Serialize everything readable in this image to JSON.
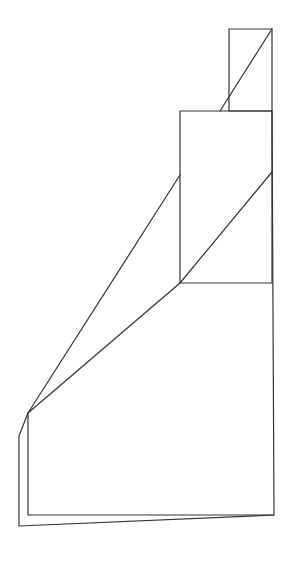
{
  "diagram": {
    "kind": "line-drawing",
    "width": 291,
    "height": 564,
    "background": "#ffffff",
    "stroke_color": "#333333",
    "stroke_width": 1.2,
    "shapes": [
      {
        "name": "top-small-rect",
        "type": "rect",
        "x": 229,
        "y": 29,
        "w": 43,
        "h": 82
      },
      {
        "name": "middle-rect",
        "type": "rect",
        "x": 180,
        "y": 111,
        "w": 92,
        "h": 172
      },
      {
        "name": "top-diagonal",
        "type": "polyline",
        "points": "272,29 220,111"
      },
      {
        "name": "outer-slant-line",
        "type": "polyline",
        "points": "28,413 180,175"
      },
      {
        "name": "inner-slant-line",
        "type": "polyline",
        "points": "28,413 180,283 272,172"
      },
      {
        "name": "front-face",
        "type": "polyline",
        "points": "28,413 28,515 274,515 272,111"
      },
      {
        "name": "back-face",
        "type": "polyline",
        "points": "28,413 19,436 19,526 274,515"
      }
    ]
  }
}
